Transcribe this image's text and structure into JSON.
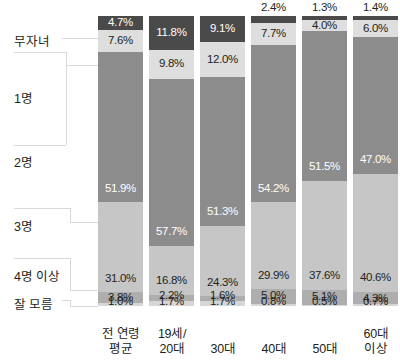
{
  "chart_data": {
    "type": "bar",
    "subtype": "stacked-100-percent",
    "orientation": "vertical",
    "title": "",
    "subtitle": "",
    "xlabel": "",
    "ylabel": "",
    "ylim": [
      0,
      100
    ],
    "grid": false,
    "legend_position": "left",
    "value_suffix": "%",
    "stack_order": "top-to-bottom",
    "categories": [
      "전 연령\n평균",
      "19세/\n20대",
      "30대",
      "40대",
      "50대",
      "60대\n이상"
    ],
    "category_labels": [
      {
        "line1": "전 연령",
        "line2": "평균"
      },
      {
        "line1": "19세/",
        "line2": "20대"
      },
      {
        "line1": "30대",
        "line2": ""
      },
      {
        "line1": "40대",
        "line2": ""
      },
      {
        "line1": "50대",
        "line2": ""
      },
      {
        "line1": "60대",
        "line2": "이상"
      }
    ],
    "series": [
      {
        "name": "무자녀",
        "color": "#4a4a4a",
        "values": [
          4.7,
          11.8,
          9.1,
          2.4,
          1.3,
          1.4
        ]
      },
      {
        "name": "1명",
        "color": "#dedede",
        "values": [
          7.6,
          9.8,
          12.0,
          7.7,
          4.0,
          6.0
        ]
      },
      {
        "name": "2명",
        "color": "#8c8c8c",
        "values": [
          51.9,
          57.7,
          51.3,
          54.2,
          51.5,
          47.0
        ]
      },
      {
        "name": "3명",
        "color": "#c6c6c6",
        "values": [
          31.0,
          16.8,
          24.3,
          29.9,
          37.6,
          40.6
        ]
      },
      {
        "name": "4명 이상",
        "color": "#aeaeae",
        "values": [
          3.8,
          2.2,
          1.6,
          5.0,
          5.1,
          4.3
        ]
      },
      {
        "name": "잘 모름",
        "color": "#d6d6d6",
        "values": [
          1.0,
          1.7,
          1.7,
          0.8,
          0.5,
          0.7
        ]
      }
    ],
    "bars": [
      {
        "category": "전 연령 평균",
        "segments": [
          {
            "label": "무자녀",
            "value": "4.7%",
            "number": 4.7
          },
          {
            "label": "1명",
            "value": "7.6%",
            "number": 7.6
          },
          {
            "label": "2명",
            "value": "51.9%",
            "number": 51.9
          },
          {
            "label": "3명",
            "value": "31.0%",
            "number": 31.0
          },
          {
            "label": "4명 이상",
            "value": "3.8%",
            "number": 3.8
          },
          {
            "label": "잘 모름",
            "value": "1.0%",
            "number": 1.0
          }
        ]
      },
      {
        "category": "19세/20대",
        "segments": [
          {
            "label": "무자녀",
            "value": "11.8%",
            "number": 11.8
          },
          {
            "label": "1명",
            "value": "9.8%",
            "number": 9.8
          },
          {
            "label": "2명",
            "value": "57.7%",
            "number": 57.7
          },
          {
            "label": "3명",
            "value": "16.8%",
            "number": 16.8
          },
          {
            "label": "4명 이상",
            "value": "2.2%",
            "number": 2.2
          },
          {
            "label": "잘 모름",
            "value": "1.7%",
            "number": 1.7
          }
        ]
      },
      {
        "category": "30대",
        "segments": [
          {
            "label": "무자녀",
            "value": "9.1%",
            "number": 9.1
          },
          {
            "label": "1명",
            "value": "12.0%",
            "number": 12.0
          },
          {
            "label": "2명",
            "value": "51.3%",
            "number": 51.3
          },
          {
            "label": "3명",
            "value": "24.3%",
            "number": 24.3
          },
          {
            "label": "4명 이상",
            "value": "1.6%",
            "number": 1.6
          },
          {
            "label": "잘 모름",
            "value": "1.7%",
            "number": 1.7
          }
        ]
      },
      {
        "category": "40대",
        "segments": [
          {
            "label": "무자녀",
            "value": "2.4%",
            "number": 2.4
          },
          {
            "label": "1명",
            "value": "7.7%",
            "number": 7.7
          },
          {
            "label": "2명",
            "value": "54.2%",
            "number": 54.2
          },
          {
            "label": "3명",
            "value": "29.9%",
            "number": 29.9
          },
          {
            "label": "4명 이상",
            "value": "5.0%",
            "number": 5.0
          },
          {
            "label": "잘 모름",
            "value": "0.8%",
            "number": 0.8
          }
        ]
      },
      {
        "category": "50대",
        "segments": [
          {
            "label": "무자녀",
            "value": "1.3%",
            "number": 1.3
          },
          {
            "label": "1명",
            "value": "4.0%",
            "number": 4.0
          },
          {
            "label": "2명",
            "value": "51.5%",
            "number": 51.5
          },
          {
            "label": "3명",
            "value": "37.6%",
            "number": 37.6
          },
          {
            "label": "4명 이상",
            "value": "5.1%",
            "number": 5.1
          },
          {
            "label": "잘 모름",
            "value": "0.5%",
            "number": 0.5
          }
        ]
      },
      {
        "category": "60대 이상",
        "segments": [
          {
            "label": "무자녀",
            "value": "1.4%",
            "number": 1.4
          },
          {
            "label": "1명",
            "value": "6.0%",
            "number": 6.0
          },
          {
            "label": "2명",
            "value": "47.0%",
            "number": 47.0
          },
          {
            "label": "3명",
            "value": "40.6%",
            "number": 40.6
          },
          {
            "label": "4명 이상",
            "value": "4.3%",
            "number": 4.3
          },
          {
            "label": "잘 모름",
            "value": "0.7%",
            "number": 0.7
          }
        ]
      }
    ]
  },
  "legend": {
    "items": [
      {
        "label": "무자녀",
        "color": "#4a4a4a"
      },
      {
        "label": "1명",
        "color": "#dedede"
      },
      {
        "label": "2명",
        "color": "#8c8c8c"
      },
      {
        "label": "3명",
        "color": "#c6c6c6"
      },
      {
        "label": "4명 이상",
        "color": "#aeaeae"
      },
      {
        "label": "잘 모름",
        "color": "#d6d6d6"
      }
    ]
  },
  "colors": {
    "background": "#ffffff",
    "text": "#231f20",
    "text_on_dark": "#ffffff",
    "connector": "#d9d9d9"
  }
}
